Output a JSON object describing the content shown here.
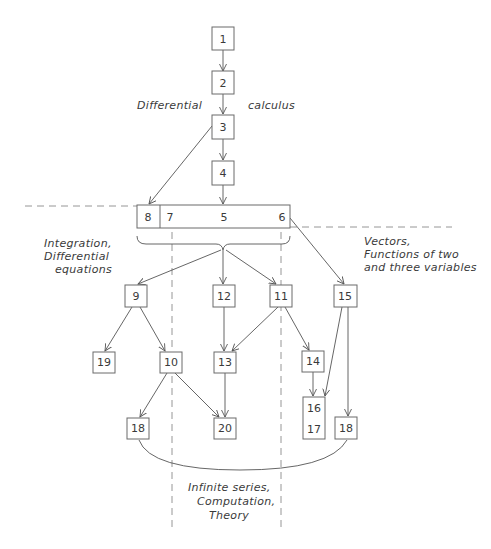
{
  "diagram": {
    "regions": {
      "differential_left": "Differential",
      "differential_right": "calculus",
      "integration": [
        "Integration,",
        "Differential",
        "equations"
      ],
      "vectors": [
        "Vectors,",
        "Functions of two",
        "and three variables"
      ],
      "infinite": [
        "Infinite series,",
        "Computation,",
        "Theory"
      ]
    },
    "nodes": {
      "n1": "1",
      "n2": "2",
      "n3": "3",
      "n4": "4",
      "n8": "8",
      "n7": "7",
      "n5": "5",
      "n6": "6",
      "n9": "9",
      "n12": "12",
      "n11": "11",
      "n15": "15",
      "n19": "19",
      "n10": "10",
      "n13": "13",
      "n14": "14",
      "n18a": "18",
      "n20": "20",
      "n16": "16",
      "n17": "17",
      "n18b": "18"
    },
    "edges": [
      [
        "1",
        "2"
      ],
      [
        "2",
        "3"
      ],
      [
        "3",
        "4"
      ],
      [
        "4",
        "5"
      ],
      [
        "3",
        "8"
      ],
      [
        "5-7-6 group",
        "9"
      ],
      [
        "5-7-6 group",
        "12"
      ],
      [
        "5-7-6 group",
        "11"
      ],
      [
        "6",
        "15"
      ],
      [
        "9",
        "19"
      ],
      [
        "9",
        "10"
      ],
      [
        "12",
        "13"
      ],
      [
        "11",
        "13"
      ],
      [
        "11",
        "14"
      ],
      [
        "10",
        "18"
      ],
      [
        "10",
        "20"
      ],
      [
        "13",
        "20"
      ],
      [
        "14",
        "16"
      ],
      [
        "15",
        "16"
      ],
      [
        "15",
        "18"
      ]
    ]
  }
}
